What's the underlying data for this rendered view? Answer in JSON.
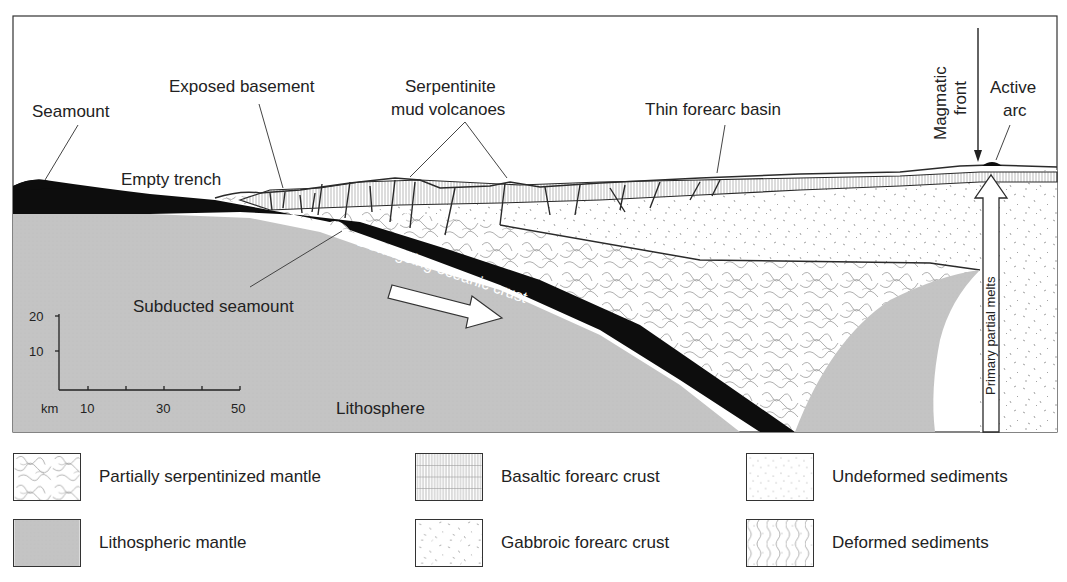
{
  "diagram": {
    "labels": {
      "seamount": "Seamount",
      "exposed_basement": "Exposed basement",
      "serpentinite_line1": "Serpentinite",
      "serpentinite_line2": "mud volcanoes",
      "thin_forearc_basin": "Thin forearc basin",
      "magmatic_front_line1": "Magmatic",
      "magmatic_front_line2": "front",
      "active_arc_line1": "Active",
      "active_arc_line2": "arc",
      "empty_trench": "Empty trench",
      "downgoing_crust": "Downgoing oceanic crust",
      "subducted_seamount": "Subducted seamount",
      "lithosphere": "Lithosphere",
      "primary_partial_melts": "Primary partial melts"
    },
    "scale": {
      "unit": "km",
      "y_ticks": [
        "20",
        "10"
      ],
      "x_ticks": [
        "10",
        "30",
        "50"
      ]
    },
    "colors": {
      "crust": "#0d0d0d",
      "lithospheric_mantle": "#c4c4c4",
      "line": "#2a2a2a",
      "pattern": "#9a9a9a"
    }
  },
  "legend": {
    "items": [
      {
        "id": "serpentinized",
        "label": "Partially serpentinized mantle"
      },
      {
        "id": "lithospheric",
        "label": "Lithospheric mantle"
      },
      {
        "id": "basaltic",
        "label": "Basaltic forearc crust"
      },
      {
        "id": "gabbroic",
        "label": "Gabbroic forearc crust"
      },
      {
        "id": "undeformed",
        "label": "Undeformed sediments"
      },
      {
        "id": "deformed",
        "label": "Deformed sediments"
      }
    ]
  }
}
